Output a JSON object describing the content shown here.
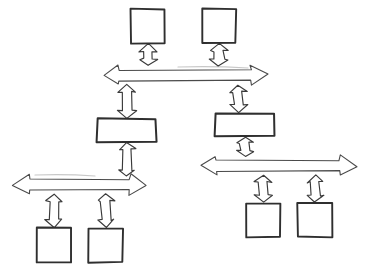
{
  "diagram": {
    "style": "hand-drawn sketch, black ink on white paper",
    "background_color": "#ffffff",
    "stroke_color": "#2f2f2f",
    "arrow_stroke_color": "#4a4a4a",
    "fill_color": "#ffffff",
    "width": 371,
    "height": 272,
    "nodes": [
      {
        "id": "top-left-box",
        "label": "",
        "shape": "square",
        "x": 131,
        "y": 9,
        "w": 34,
        "h": 34
      },
      {
        "id": "top-right-box",
        "label": "",
        "shape": "square",
        "x": 202,
        "y": 9,
        "w": 34,
        "h": 34
      },
      {
        "id": "middle-left-box",
        "label": "",
        "shape": "rectangle",
        "x": 97,
        "y": 119,
        "w": 59,
        "h": 23
      },
      {
        "id": "middle-right-box",
        "label": "",
        "shape": "rectangle",
        "x": 215,
        "y": 113,
        "w": 59,
        "h": 23
      },
      {
        "id": "bottom-left-box-1",
        "label": "",
        "shape": "square",
        "x": 37,
        "y": 228,
        "w": 34,
        "h": 34
      },
      {
        "id": "bottom-left-box-2",
        "label": "",
        "shape": "square",
        "x": 89,
        "y": 228,
        "w": 34,
        "h": 34
      },
      {
        "id": "bottom-right-box-1",
        "label": "",
        "shape": "square",
        "x": 246,
        "y": 203,
        "w": 34,
        "h": 34
      },
      {
        "id": "bottom-right-box-2",
        "label": "",
        "shape": "square",
        "x": 298,
        "y": 203,
        "w": 34,
        "h": 34
      }
    ],
    "horizontal_arrows": [
      {
        "id": "top-horizontal-arrow",
        "label": "",
        "x1": 103,
        "x2": 267,
        "cy": 75,
        "thickness": 20,
        "head": 16
      },
      {
        "id": "bottom-left-horizontal-arrow",
        "label": "",
        "x1": 13,
        "x2": 146,
        "cy": 185,
        "thickness": 20,
        "head": 16
      },
      {
        "id": "bottom-right-horizontal-arrow",
        "label": "",
        "x1": 200,
        "x2": 356,
        "cy": 166,
        "thickness": 20,
        "head": 16
      }
    ],
    "vertical_arrows": [
      {
        "id": "arrow-top-left-box-to-bar",
        "label": "",
        "cx": 148,
        "y1": 44,
        "y2": 66,
        "width": 18,
        "head": 7
      },
      {
        "id": "arrow-top-right-box-to-bar",
        "label": "",
        "cx": 219,
        "y1": 44,
        "y2": 66,
        "width": 18,
        "head": 7
      },
      {
        "id": "arrow-bar-to-middle-left-box",
        "label": "",
        "cx": 127,
        "y1": 85,
        "y2": 118,
        "width": 18,
        "head": 7
      },
      {
        "id": "arrow-bar-to-middle-right-box",
        "label": "",
        "cx": 238,
        "y1": 85,
        "y2": 112,
        "width": 18,
        "head": 7
      },
      {
        "id": "arrow-middle-left-box-to-bar",
        "label": "",
        "cx": 127,
        "y1": 143,
        "y2": 176,
        "width": 16,
        "head": 6
      },
      {
        "id": "arrow-middle-right-box-to-bar",
        "label": "",
        "cx": 245,
        "y1": 137,
        "y2": 157,
        "width": 16,
        "head": 6
      },
      {
        "id": "arrow-bar-to-bottom-left-box-1",
        "label": "",
        "cx": 54,
        "y1": 194,
        "y2": 227,
        "width": 17,
        "head": 7
      },
      {
        "id": "arrow-bar-to-bottom-left-box-2",
        "label": "",
        "cx": 106,
        "y1": 194,
        "y2": 227,
        "width": 17,
        "head": 7
      },
      {
        "id": "arrow-bar-to-bottom-right-box-1",
        "label": "",
        "cx": 263,
        "y1": 175,
        "y2": 202,
        "width": 17,
        "head": 7
      },
      {
        "id": "arrow-bar-to-bottom-right-box-2",
        "label": "",
        "cx": 315,
        "y1": 175,
        "y2": 202,
        "width": 17,
        "head": 7
      }
    ],
    "smudges": [
      {
        "id": "smudge-top-bar",
        "x1": 178,
        "y1": 67,
        "x2": 248,
        "y2": 68
      },
      {
        "id": "smudge-middle-bar",
        "x1": 35,
        "y1": 175,
        "x2": 95,
        "y2": 176
      }
    ]
  }
}
